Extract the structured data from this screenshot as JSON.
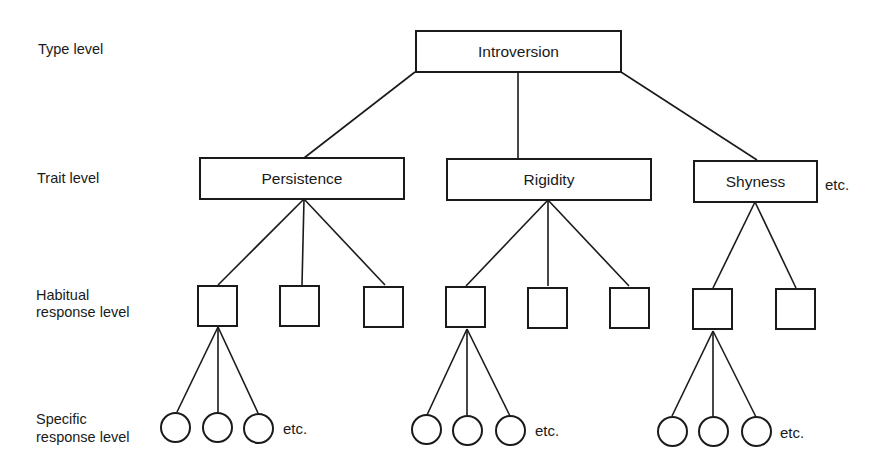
{
  "levels": {
    "type": "Type level",
    "trait": "Trait level",
    "habitual_line1": "Habitual",
    "habitual_line2": "response level",
    "specific_line1": "Specific",
    "specific_line2": "response level"
  },
  "type_node": {
    "label": "Introversion"
  },
  "traits": [
    {
      "label": "Persistence"
    },
    {
      "label": "Rigidity"
    },
    {
      "label": "Shyness"
    }
  ],
  "etc_label": "etc.",
  "colors": {
    "line": "#1a1a1a",
    "background": "#ffffff"
  }
}
